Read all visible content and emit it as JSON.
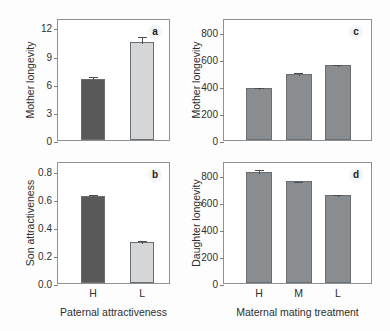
{
  "figure": {
    "background_color": "#fdfdfd",
    "axis_color": "#8e9294",
    "bar_dark_color": "#595959",
    "bar_light_color": "#d4d6d8",
    "bar_medium_color": "#8a8d8f"
  },
  "chart_data": [
    {
      "type": "bar",
      "panel_letter": "a",
      "title": "",
      "xlabel": "",
      "ylabel": "Mother longevity",
      "categories": [
        "H",
        "L"
      ],
      "values": [
        6.5,
        10.45
      ],
      "errors": [
        0.4,
        0.75
      ],
      "bar_colors": [
        "#595959",
        "#d4d6d8"
      ],
      "yticks": [
        0,
        3,
        6,
        9,
        12
      ],
      "ytick_labels": [
        "0",
        "3",
        "6",
        "9",
        "12"
      ],
      "ylim": [
        0,
        13.0
      ],
      "grid": false,
      "show_xtick_labels": false
    },
    {
      "type": "bar",
      "panel_letter": "b",
      "title": "",
      "xlabel": "Paternal attractiveness",
      "ylabel": "Son attractiveness",
      "categories": [
        "H",
        "L"
      ],
      "values": [
        0.62,
        0.29
      ],
      "errors": [
        0.025,
        0.025
      ],
      "bar_colors": [
        "#595959",
        "#d4d6d8"
      ],
      "yticks": [
        0.0,
        0.2,
        0.4,
        0.6,
        0.8
      ],
      "ytick_labels": [
        "0.0",
        "0.2",
        "0.4",
        "0.6",
        "0.8"
      ],
      "ylim": [
        0,
        0.87
      ],
      "grid": false,
      "show_xtick_labels": true
    },
    {
      "type": "bar",
      "panel_letter": "c",
      "title": "",
      "xlabel": "",
      "ylabel": "Mother longevity",
      "categories": [
        "H",
        "M",
        "L"
      ],
      "values": [
        385,
        490,
        550
      ],
      "errors": [
        10,
        22,
        18
      ],
      "bar_colors": [
        "#8a8d8f",
        "#8a8d8f",
        "#8a8d8f"
      ],
      "yticks": [
        0,
        200,
        400,
        600,
        800
      ],
      "ytick_labels": [
        "0",
        "200",
        "400",
        "600",
        "800"
      ],
      "ylim": [
        0,
        900
      ],
      "grid": false,
      "show_xtick_labels": false
    },
    {
      "type": "bar",
      "panel_letter": "d",
      "title": "",
      "xlabel": "Maternal mating treatment",
      "ylabel": "Daughter longevity",
      "categories": [
        "H",
        "M",
        "L"
      ],
      "values": [
        820,
        750,
        650
      ],
      "errors": [
        25,
        12,
        12
      ],
      "bar_colors": [
        "#8a8d8f",
        "#8a8d8f",
        "#8a8d8f"
      ],
      "yticks": [
        0,
        200,
        400,
        600,
        800
      ],
      "ytick_labels": [
        "0",
        "200",
        "400",
        "600",
        "800"
      ],
      "ylim": [
        0,
        900
      ],
      "grid": false,
      "show_xtick_labels": true
    }
  ]
}
